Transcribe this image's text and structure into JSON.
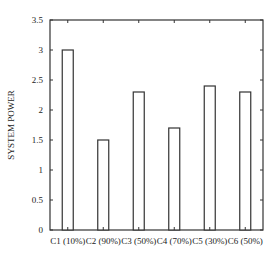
{
  "chart_data": {
    "type": "bar",
    "title": "",
    "xlabel": "",
    "ylabel": "SYSTEM POWER",
    "categories": [
      "C1 (10%)",
      "C2 (90%)",
      "C3 (50%)",
      "C4 (70%)",
      "C5 (30%)",
      "C6 (50%)"
    ],
    "values": [
      3.0,
      1.5,
      2.3,
      1.7,
      2.4,
      2.3
    ],
    "ylim": [
      0,
      3.5
    ],
    "yticks": [
      "0",
      "0.5",
      "1",
      "1.5",
      "2",
      "2.5",
      "3",
      "3.5"
    ],
    "grid": false,
    "legend": null,
    "bar_fill": "#ffffff",
    "bar_stroke": "#333333"
  }
}
